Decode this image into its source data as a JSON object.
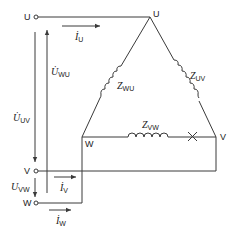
{
  "diagram": {
    "type": "three-phase delta load circuit",
    "terminals": [
      {
        "id": "U",
        "label": "U"
      },
      {
        "id": "V",
        "label": "V"
      },
      {
        "id": "W",
        "label": "W"
      }
    ],
    "vertices": [
      {
        "id": "U",
        "label": "U"
      },
      {
        "id": "V",
        "label": "V"
      },
      {
        "id": "W",
        "label": "W"
      }
    ],
    "impedances": [
      {
        "id": "Z_WU",
        "symbol": "Z",
        "sub": "WU"
      },
      {
        "id": "Z_UV",
        "symbol": "Z",
        "sub": "UV"
      },
      {
        "id": "Z_VW",
        "symbol": "Z",
        "sub": "VW"
      }
    ],
    "currents": [
      {
        "id": "I_U",
        "symbol": "İ",
        "sub": "U"
      },
      {
        "id": "I_V",
        "symbol": "İ",
        "sub": "V"
      },
      {
        "id": "I_W",
        "symbol": "İ",
        "sub": "W"
      }
    ],
    "voltages": [
      {
        "id": "U_WU",
        "symbol": "U̇",
        "sub": "WU"
      },
      {
        "id": "U_UV",
        "symbol": "U̇",
        "sub": "UV"
      },
      {
        "id": "U_VW",
        "symbol": "U",
        "sub": "VW"
      }
    ],
    "break_mark": "×",
    "colors": {
      "line": "#3a3a3a",
      "text": "#222222",
      "background": "#ffffff"
    }
  }
}
